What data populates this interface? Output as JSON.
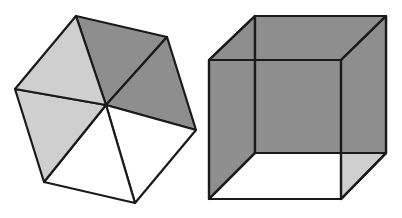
{
  "figure": {
    "colors": {
      "light": "#cfcfcf",
      "dark": "#8e8e8e",
      "white": "#ffffff",
      "stroke": "#1a1a1a"
    },
    "hexagon": {
      "center": [
        106,
        105
      ],
      "vertices": [
        [
          76,
          16
        ],
        [
          167,
          37
        ],
        [
          196,
          130
        ],
        [
          135,
          203
        ],
        [
          44,
          182
        ],
        [
          15,
          89
        ]
      ],
      "triangle_fills": [
        "dark",
        "dark",
        "white",
        "white",
        "light",
        "light"
      ]
    },
    "cube": {
      "back_square": [
        [
          255,
          16
        ],
        [
          386,
          16
        ],
        [
          386,
          153
        ],
        [
          255,
          153
        ]
      ],
      "front_square": [
        [
          209,
          60
        ],
        [
          341,
          60
        ],
        [
          341,
          199
        ],
        [
          209,
          199
        ]
      ]
    }
  }
}
